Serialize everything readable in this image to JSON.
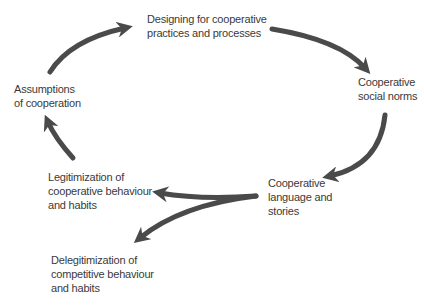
{
  "diagram": {
    "type": "cycle",
    "nodes": [
      {
        "id": "designing",
        "label": "Designing for cooperative\npractices and processes"
      },
      {
        "id": "norms",
        "label": "Cooperative\nsocial norms"
      },
      {
        "id": "language",
        "label": "Cooperative\nlanguage and\nstories"
      },
      {
        "id": "legitimization",
        "label": "Legitimization of\ncooperative behaviour\nand habits"
      },
      {
        "id": "delegitimization",
        "label": "Delegitimization of\ncompetitive behaviour\nand habits"
      },
      {
        "id": "assumptions",
        "label": "Assumptions\nof cooperation"
      }
    ],
    "edges": [
      {
        "from": "assumptions",
        "to": "designing"
      },
      {
        "from": "designing",
        "to": "norms"
      },
      {
        "from": "norms",
        "to": "language"
      },
      {
        "from": "language",
        "to": "legitimization"
      },
      {
        "from": "language",
        "to": "delegitimization"
      },
      {
        "from": "legitimization",
        "to": "assumptions"
      }
    ],
    "arrow_color": "#4a4a4a",
    "text_color": "#3a3a3a"
  }
}
